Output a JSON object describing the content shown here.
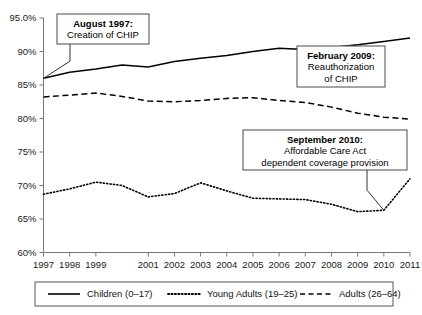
{
  "chart_data": {
    "type": "line",
    "title": "",
    "xlabel": "",
    "ylabel": "",
    "ylim": [
      60,
      95
    ],
    "xlim": [
      1997,
      2011
    ],
    "grid": false,
    "legend_position": "bottom",
    "ytick_labels": [
      "95.0%",
      "90%",
      "85%",
      "80%",
      "75%",
      "70%",
      "65%",
      "60%"
    ],
    "ytick_values": [
      95,
      90,
      85,
      80,
      75,
      70,
      65,
      60
    ],
    "xtick_labels": [
      "1997",
      "1998",
      "1999",
      "2001",
      "2002",
      "2003",
      "2004",
      "2005",
      "2006",
      "2007",
      "2008",
      "2009",
      "2010",
      "2011"
    ],
    "xtick_values": [
      1997,
      1998,
      1999,
      2001,
      2002,
      2003,
      2004,
      2005,
      2006,
      2007,
      2008,
      2009,
      2010,
      2011
    ],
    "x": [
      1997,
      1998,
      1999,
      2000,
      2001,
      2002,
      2003,
      2004,
      2005,
      2006,
      2007,
      2008,
      2009,
      2010,
      2011
    ],
    "series": [
      {
        "name": "Children (0–17)",
        "style": "solid",
        "values": [
          86.0,
          86.9,
          87.4,
          88.0,
          87.7,
          88.5,
          89.0,
          89.4,
          90.0,
          90.5,
          90.3,
          90.6,
          91.0,
          91.5,
          92.0
        ]
      },
      {
        "name": "Young Adults (19–25)",
        "style": "dotted",
        "values": [
          68.7,
          69.5,
          70.5,
          70.0,
          68.3,
          68.8,
          70.4,
          69.2,
          68.1,
          68.0,
          67.9,
          67.2,
          66.1,
          66.3,
          71.0
        ]
      },
      {
        "name": "Adults (26–64)",
        "style": "dashed",
        "values": [
          83.2,
          83.5,
          83.8,
          83.3,
          82.6,
          82.5,
          82.7,
          83.0,
          83.1,
          82.7,
          82.4,
          81.7,
          80.8,
          80.2,
          79.9
        ]
      }
    ],
    "annotations": [
      {
        "id": "august-1997",
        "title": "August 1997:",
        "lines": [
          "Creation of CHIP"
        ],
        "target_x": 1997,
        "target_y": 86.0
      },
      {
        "id": "february-2009",
        "title": "February 2009:",
        "lines": [
          "Reauthorization",
          "of CHIP"
        ],
        "target_x": 2009,
        "target_y": 91.0
      },
      {
        "id": "september-2010",
        "title": "September 2010:",
        "lines": [
          "Affordable Care Act",
          "dependent coverage provision"
        ],
        "target_x": 2010,
        "target_y": 66.3
      }
    ]
  },
  "legend": {
    "entries": [
      {
        "label": "Children (0–17)",
        "style": "solid"
      },
      {
        "label": "Young Adults (19–25)",
        "style": "dotted"
      },
      {
        "label": "Adults (26–64)",
        "style": "dashed"
      }
    ]
  }
}
